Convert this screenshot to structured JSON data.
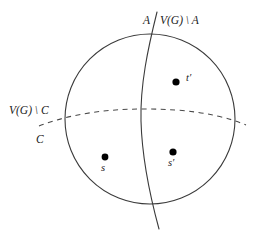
{
  "figure": {
    "background_color": "#ffffff",
    "stroke_color": "#3a3a3a",
    "point_color": "#000000"
  },
  "labels": {
    "a": "A",
    "not_a": "V(G) \\ A",
    "not_c": "V(G) \\ C",
    "c": "C",
    "s": "s",
    "s_prime": "s′",
    "t_prime": "t′"
  },
  "shapes": {
    "circle": {
      "cx": 150,
      "cy": 119,
      "r": 85,
      "style": "solid"
    },
    "vertical_curve": {
      "style": "solid",
      "from_y": 12,
      "to_y": 229
    },
    "dashed_arc": {
      "style": "dashed",
      "from_x": 39,
      "to_x": 246
    }
  },
  "points": [
    {
      "name": "s",
      "x": 105,
      "y": 157,
      "label": "s",
      "label_position": "below"
    },
    {
      "name": "s-prime",
      "x": 173,
      "y": 152,
      "label": "s′",
      "label_position": "below"
    },
    {
      "name": "t-prime",
      "x": 176,
      "y": 82,
      "label": "t′",
      "label_position": "right"
    }
  ]
}
